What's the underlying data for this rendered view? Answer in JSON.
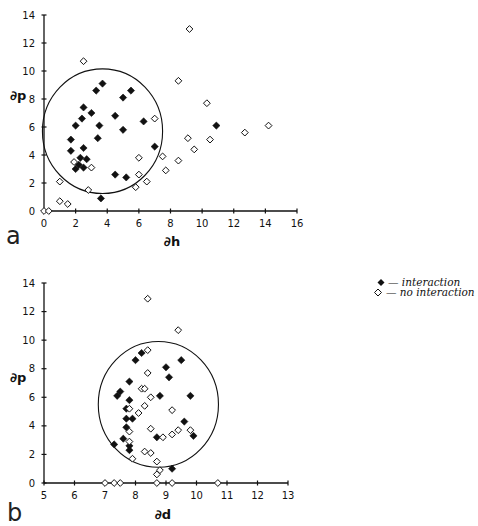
{
  "chart_data": [
    {
      "type": "scatter",
      "panel_label": "a",
      "title": "",
      "xlabel": "∂h",
      "ylabel": "∂p",
      "xlim": [
        0,
        16
      ],
      "ylim": [
        0,
        14
      ],
      "xticks": [
        0,
        2,
        4,
        6,
        8,
        10,
        12,
        14,
        16
      ],
      "yticks": [
        0,
        2,
        4,
        6,
        8,
        10,
        12,
        14
      ],
      "grid": false,
      "circle": {
        "cx": 3.7,
        "cy": 5.7,
        "rx": 3.8,
        "ry": 4.45
      },
      "series": [
        {
          "name": "interaction",
          "marker": "filled-diamond",
          "points": [
            [
              1.7,
              5.1
            ],
            [
              1.7,
              4.3
            ],
            [
              2.0,
              6.1
            ],
            [
              2.0,
              3.0
            ],
            [
              2.2,
              3.3
            ],
            [
              2.3,
              3.8
            ],
            [
              2.4,
              6.6
            ],
            [
              2.5,
              7.4
            ],
            [
              2.5,
              4.5
            ],
            [
              2.5,
              3.1
            ],
            [
              2.7,
              3.7
            ],
            [
              3.0,
              7.0
            ],
            [
              3.3,
              8.6
            ],
            [
              3.4,
              5.2
            ],
            [
              3.5,
              6.1
            ],
            [
              3.7,
              9.1
            ],
            [
              3.6,
              0.9
            ],
            [
              4.5,
              6.8
            ],
            [
              4.5,
              2.6
            ],
            [
              5.0,
              8.1
            ],
            [
              5.0,
              5.8
            ],
            [
              5.2,
              2.4
            ],
            [
              5.5,
              8.6
            ],
            [
              6.3,
              6.4
            ],
            [
              7.0,
              4.6
            ],
            [
              10.9,
              6.1
            ]
          ]
        },
        {
          "name": "no interaction",
          "marker": "open-diamond",
          "points": [
            [
              0.0,
              0.0
            ],
            [
              0.3,
              0.0
            ],
            [
              1.0,
              0.7
            ],
            [
              1.5,
              0.5
            ],
            [
              1.0,
              2.1
            ],
            [
              2.5,
              10.7
            ],
            [
              3.0,
              3.1
            ],
            [
              2.8,
              1.5
            ],
            [
              5.8,
              1.7
            ],
            [
              6.0,
              2.6
            ],
            [
              6.0,
              3.8
            ],
            [
              6.5,
              2.1
            ],
            [
              7.0,
              6.6
            ],
            [
              7.5,
              3.9
            ],
            [
              7.7,
              2.9
            ],
            [
              8.5,
              3.6
            ],
            [
              8.5,
              9.3
            ],
            [
              9.1,
              5.2
            ],
            [
              9.2,
              13.0
            ],
            [
              9.5,
              4.4
            ],
            [
              10.3,
              7.7
            ],
            [
              10.5,
              5.1
            ],
            [
              12.7,
              5.6
            ],
            [
              14.2,
              6.1
            ],
            [
              1.9,
              3.5
            ]
          ]
        }
      ]
    },
    {
      "type": "scatter",
      "panel_label": "b",
      "title": "",
      "xlabel": "∂d",
      "ylabel": "∂p",
      "xlim": [
        5,
        13
      ],
      "ylim": [
        0,
        14
      ],
      "xticks": [
        5,
        6,
        7,
        8,
        9,
        10,
        11,
        12,
        13
      ],
      "yticks": [
        0,
        2,
        4,
        6,
        8,
        10,
        12,
        14
      ],
      "grid": false,
      "circle": {
        "cx": 8.75,
        "cy": 5.5,
        "rx": 1.97,
        "ry": 4.4
      },
      "series": [
        {
          "name": "interaction",
          "marker": "filled-diamond",
          "points": [
            [
              7.3,
              2.7
            ],
            [
              7.4,
              6.1
            ],
            [
              7.5,
              6.4
            ],
            [
              7.6,
              3.1
            ],
            [
              7.7,
              5.2
            ],
            [
              7.7,
              3.9
            ],
            [
              7.7,
              4.5
            ],
            [
              7.8,
              7.1
            ],
            [
              7.8,
              5.8
            ],
            [
              7.8,
              2.6
            ],
            [
              7.8,
              2.3
            ],
            [
              7.9,
              4.5
            ],
            [
              8.0,
              8.6
            ],
            [
              8.2,
              9.1
            ],
            [
              8.7,
              3.2
            ],
            [
              8.8,
              6.1
            ],
            [
              9.0,
              8.1
            ],
            [
              9.1,
              7.4
            ],
            [
              9.2,
              1.0
            ],
            [
              9.5,
              8.6
            ],
            [
              9.6,
              4.3
            ],
            [
              9.8,
              6.1
            ],
            [
              9.9,
              3.3
            ]
          ]
        },
        {
          "name": "no interaction",
          "marker": "open-diamond",
          "points": [
            [
              7.0,
              0.0
            ],
            [
              7.3,
              0.0
            ],
            [
              7.5,
              0.0
            ],
            [
              7.8,
              5.2
            ],
            [
              7.8,
              3.6
            ],
            [
              7.8,
              2.9
            ],
            [
              7.9,
              1.7
            ],
            [
              8.1,
              4.9
            ],
            [
              8.2,
              6.6
            ],
            [
              8.3,
              6.6
            ],
            [
              8.3,
              2.2
            ],
            [
              8.3,
              5.4
            ],
            [
              8.4,
              9.3
            ],
            [
              8.4,
              7.7
            ],
            [
              8.4,
              12.9
            ],
            [
              8.5,
              6.0
            ],
            [
              8.5,
              3.8
            ],
            [
              8.5,
              2.1
            ],
            [
              8.7,
              1.5
            ],
            [
              8.7,
              0.6
            ],
            [
              8.7,
              0.0
            ],
            [
              8.8,
              0.9
            ],
            [
              8.9,
              3.2
            ],
            [
              9.2,
              3.4
            ],
            [
              9.2,
              5.1
            ],
            [
              9.2,
              0.0
            ],
            [
              9.4,
              3.7
            ],
            [
              9.4,
              10.7
            ],
            [
              9.8,
              3.7
            ],
            [
              10.7,
              0.0
            ]
          ]
        }
      ]
    }
  ],
  "legend": {
    "items": [
      {
        "marker": "filled-diamond",
        "label": "— interaction"
      },
      {
        "marker": "open-diamond",
        "label": "— no interaction"
      }
    ]
  },
  "colors": {
    "ink": "#111111",
    "background": "#ffffff"
  }
}
